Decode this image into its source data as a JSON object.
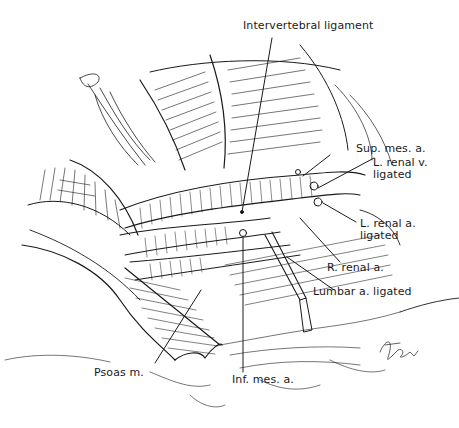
{
  "figure": {
    "type": "surgical anatomical illustration",
    "stroke_color": "#1a1a1a",
    "background": "#ffffff",
    "signature": "Kaye"
  },
  "labels": [
    {
      "id": "intervertebral-ligament",
      "line1": "Intervertebral ligament",
      "line2": ""
    },
    {
      "id": "sup-mes-a",
      "line1": "Sup. mes. a.",
      "line2": ""
    },
    {
      "id": "l-renal-v",
      "line1": "L. renal v.",
      "line2": "ligated"
    },
    {
      "id": "l-renal-a",
      "line1": "L. renal a.",
      "line2": "ligated"
    },
    {
      "id": "r-renal-a",
      "line1": "R. renal a.",
      "line2": ""
    },
    {
      "id": "lumbar-a",
      "line1": "Lumbar a. ligated",
      "line2": ""
    },
    {
      "id": "psoas-m",
      "line1": "Psoas m.",
      "line2": ""
    },
    {
      "id": "inf-mes-a",
      "line1": "Inf. mes. a.",
      "line2": ""
    }
  ]
}
